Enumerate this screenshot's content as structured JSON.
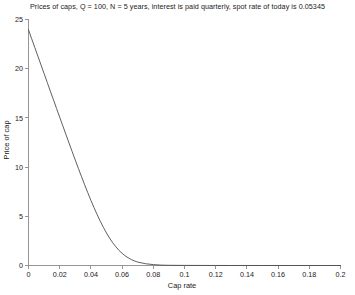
{
  "figure": {
    "background_color": "#ffffff",
    "axis_color": "#8a8a8a",
    "curve_color": "#4d4d4d",
    "text_color": "#1a1a1a"
  },
  "chart_data": {
    "type": "line",
    "title": "Prices of caps, Q = 100, N = 5 years, interest is paid quarterly, spot rate of today is 0.05345",
    "xlabel": "Cap rate",
    "ylabel": "Price of cap",
    "xlim": [
      0,
      0.2
    ],
    "ylim": [
      0,
      25
    ],
    "grid": false,
    "legend": null,
    "xticks": [
      0,
      0.02,
      0.04,
      0.06,
      0.08,
      0.1,
      0.12,
      0.14,
      0.16,
      0.18,
      0.2
    ],
    "xtick_labels": [
      "0",
      "0.02",
      "0.04",
      "0.06",
      "0.08",
      "0.1",
      "0.12",
      "0.14",
      "0.16",
      "0.18",
      "0.2"
    ],
    "yticks": [
      0,
      5,
      10,
      15,
      20,
      25
    ],
    "ytick_labels": [
      "0",
      "5",
      "10",
      "15",
      "20",
      "25"
    ],
    "series": [
      {
        "name": "Price of cap",
        "x": [
          0,
          0.002,
          0.004,
          0.006,
          0.008,
          0.01,
          0.012,
          0.014,
          0.016,
          0.018,
          0.02,
          0.022,
          0.024,
          0.026,
          0.028,
          0.03,
          0.032,
          0.034,
          0.036,
          0.038,
          0.04,
          0.042,
          0.044,
          0.046,
          0.048,
          0.05,
          0.052,
          0.054,
          0.056,
          0.058,
          0.06,
          0.062,
          0.064,
          0.066,
          0.068,
          0.07,
          0.075,
          0.08,
          0.085,
          0.09,
          0.1,
          0.11,
          0.12,
          0.13,
          0.14,
          0.15,
          0.16,
          0.17,
          0.18,
          0.19,
          0.2
        ],
        "y": [
          23.95,
          23.06,
          22.17,
          21.28,
          20.39,
          19.5,
          18.61,
          17.72,
          16.84,
          15.95,
          15.07,
          14.19,
          13.31,
          12.44,
          11.57,
          10.71,
          9.86,
          9.02,
          8.2,
          7.4,
          6.62,
          5.88,
          5.17,
          4.5,
          3.88,
          3.3,
          2.78,
          2.31,
          1.9,
          1.54,
          1.24,
          0.98,
          0.77,
          0.6,
          0.46,
          0.35,
          0.18,
          0.09,
          0.04,
          0.02,
          0.01,
          0.005,
          0.002,
          0.001,
          0.001,
          0.0,
          0.0,
          0.0,
          0.0,
          0.0,
          0.0
        ]
      }
    ]
  }
}
